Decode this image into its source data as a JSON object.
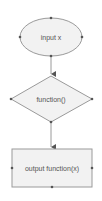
{
  "diagram": {
    "type": "flowchart",
    "colors": {
      "shape_fill": "#f2f2f2",
      "shape_stroke": "#9a9a9a",
      "connector": "#9a9a9a",
      "handle": "#555555",
      "text": "#555555"
    },
    "nodes": [
      {
        "id": "input",
        "shape": "ellipse",
        "label": "input x"
      },
      {
        "id": "function",
        "shape": "diamond",
        "label": "function()"
      },
      {
        "id": "output",
        "shape": "rectangle",
        "label": "output function(x)"
      }
    ],
    "edges": [
      {
        "from": "input",
        "to": "function"
      },
      {
        "from": "function",
        "to": "output"
      }
    ]
  }
}
